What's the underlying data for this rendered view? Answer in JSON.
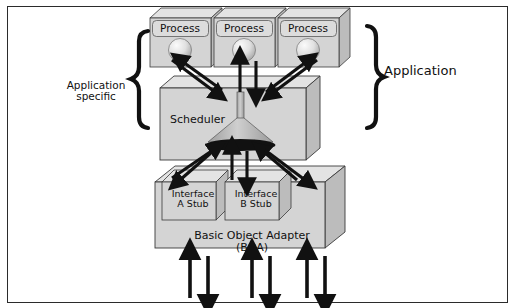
{
  "figure": {
    "type": "architecture-diagram",
    "border_color": "#2b2b2b",
    "background": "#ffffff"
  },
  "colors": {
    "box_face": "#d4d4d4",
    "box_top": "#e3e3e3",
    "box_side": "#bcbcbc",
    "label_face": "#dcdcdc",
    "sphere_light": "#f2f2f2",
    "sphere_dark": "#b8b8b8",
    "funnel": "#b9b9b9",
    "funnel_base": "#111111",
    "arrow": "#111111",
    "text": "#111111"
  },
  "annotations": {
    "left_brace_label": "Application\nspecific",
    "right_brace_label": "Application"
  },
  "processes": [
    {
      "label": "Process"
    },
    {
      "label": "Process"
    },
    {
      "label": "Process"
    }
  ],
  "scheduler": {
    "label": "Scheduler"
  },
  "stubs": [
    {
      "label": "Interface\nA Stub"
    },
    {
      "label": "Interface\nB Stub"
    }
  ],
  "adapter": {
    "label": "Basic Object Adapter\n(BOA)"
  },
  "arrows": {
    "process_scheduler_pairs": 3,
    "scheduler_stub_pairs": 3,
    "boa_external_pairs": 3,
    "direction_note": "bidirectional up/down pairs"
  }
}
